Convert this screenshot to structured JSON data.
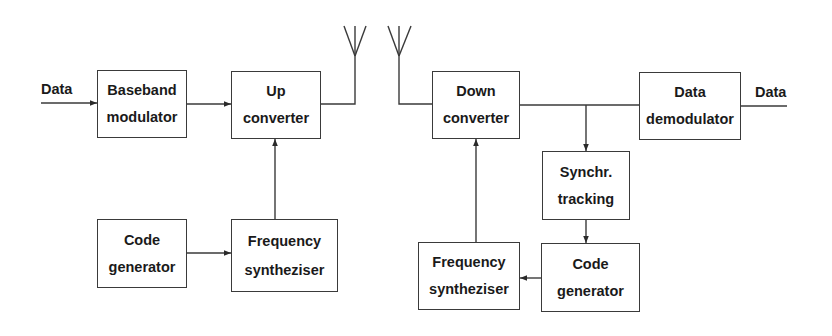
{
  "diagram": {
    "title": "",
    "line_color": "#3a3a3a",
    "transmitter": {
      "input_label": "Data",
      "blocks": [
        {
          "id": "baseband-modulator",
          "lines": [
            "Baseband",
            "modulator"
          ]
        },
        {
          "id": "up-converter",
          "lines": [
            "Up",
            "converter"
          ]
        },
        {
          "id": "code-generator-tx",
          "lines": [
            "Code",
            "generator"
          ]
        },
        {
          "id": "frequency-synthesizer-tx",
          "lines": [
            "Frequency",
            "syntheziser"
          ]
        }
      ]
    },
    "receiver": {
      "output_label": "Data",
      "blocks": [
        {
          "id": "down-converter",
          "lines": [
            "Down",
            "converter"
          ]
        },
        {
          "id": "data-demodulator",
          "lines": [
            "Data",
            "demodulator"
          ]
        },
        {
          "id": "synchr-tracking",
          "lines": [
            "Synchr.",
            "tracking"
          ]
        },
        {
          "id": "code-generator-rx",
          "lines": [
            "Code",
            "generator"
          ]
        },
        {
          "id": "frequency-synthesizer-rx",
          "lines": [
            "Frequency",
            "syntheziser"
          ]
        }
      ]
    },
    "connections": [
      {
        "from": "Data input",
        "to": "baseband-modulator"
      },
      {
        "from": "baseband-modulator",
        "to": "up-converter"
      },
      {
        "from": "code-generator-tx",
        "to": "frequency-synthesizer-tx"
      },
      {
        "from": "frequency-synthesizer-tx",
        "to": "up-converter"
      },
      {
        "from": "up-converter",
        "to": "tx-antenna"
      },
      {
        "from": "rx-antenna",
        "to": "down-converter"
      },
      {
        "from": "down-converter",
        "to": "data-demodulator"
      },
      {
        "from": "down-converter",
        "to": "synchr-tracking"
      },
      {
        "from": "synchr-tracking",
        "to": "code-generator-rx"
      },
      {
        "from": "code-generator-rx",
        "to": "frequency-synthesizer-rx"
      },
      {
        "from": "frequency-synthesizer-rx",
        "to": "down-converter"
      },
      {
        "from": "data-demodulator",
        "to": "Data output"
      }
    ]
  }
}
